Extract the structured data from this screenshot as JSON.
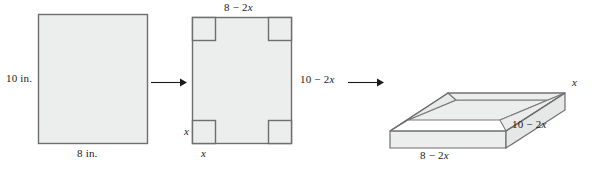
{
  "figure": {
    "steps": [
      {
        "name": "flat-sheet",
        "labels": {
          "height": "10 in.",
          "width": "8 in."
        }
      },
      {
        "name": "sheet-with-corners-removed",
        "labels": {
          "top": "8 − 2x",
          "right": "10 − 2x",
          "corner_side": "x",
          "corner_bottom": "x"
        }
      },
      {
        "name": "folded-open-box",
        "labels": {
          "height": "x",
          "depth": "10 − 2x",
          "width": "8 − 2x"
        }
      }
    ],
    "arrows": [
      {
        "name": "arrow-one"
      },
      {
        "name": "arrow-two"
      }
    ],
    "colors": {
      "fill": "#eceded",
      "stroke": "#7a7a7a",
      "outline": "#6e6e6e",
      "text": "#1a1a1a",
      "arrow": "#1a1a1a"
    }
  }
}
